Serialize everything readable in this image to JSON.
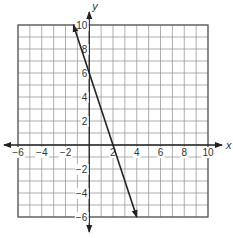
{
  "chart_data": {
    "type": "line",
    "title": "",
    "xlabel": "x",
    "ylabel": "y",
    "xlim": [
      -6,
      10
    ],
    "ylim": [
      -6,
      10
    ],
    "grid": true,
    "grid_step": 1,
    "x_ticks": [
      -6,
      -4,
      -2,
      2,
      4,
      6,
      8,
      10
    ],
    "y_ticks": [
      -6,
      -4,
      -2,
      2,
      4,
      6,
      8,
      10
    ],
    "x_tick_labels": [
      "−6",
      "−4",
      "−2",
      "2",
      "4",
      "6",
      "8",
      "10"
    ],
    "y_tick_labels": [
      "−6",
      "−4",
      "−2",
      "2",
      "4",
      "6",
      "8",
      "10"
    ],
    "series": [
      {
        "name": "line",
        "equation": "y = -3x + 6",
        "slope": -3,
        "y_intercept": 6,
        "x_intercept": 2,
        "points": [
          [
            -1.333,
            10
          ],
          [
            0,
            6
          ],
          [
            2,
            0
          ],
          [
            4,
            -6
          ]
        ],
        "arrows": "both-ends",
        "color": "#222222"
      }
    ],
    "legend": null
  },
  "colors": {
    "grid": "#9a9a9a",
    "border": "#555555",
    "axis": "#222222",
    "line": "#222222"
  }
}
